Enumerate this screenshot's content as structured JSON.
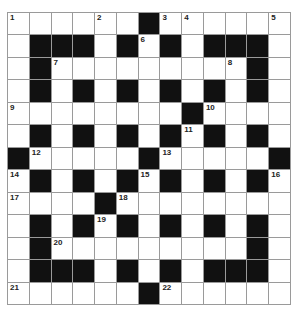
{
  "puzzle": {
    "rows": 13,
    "cols": 13,
    "colors": {
      "black": "#111111",
      "white": "#ffffff",
      "grid_line": "#9a9a9a"
    },
    "layout": [
      "WWWWWWBWWWWWW",
      "WBBBWBWBWBBBW",
      "WBWWWWWWWWWBW",
      "WBWBWBWBWBWBW",
      "WWWWWWWWBWWWW",
      "WBWBWBWBWBWBW",
      "BWWWWWBWWWWWB",
      "WBWBWBWBWBWBW",
      "WWWWBWWWWWWWW",
      "WBWBWBWBWBWBW",
      "WBWWWWWWWWWBW",
      "WBBBWBWBWBBBW",
      "WWWWWWBWWWWWW"
    ],
    "numbers": [
      {
        "r": 0,
        "c": 0,
        "n": "1"
      },
      {
        "r": 0,
        "c": 4,
        "n": "2"
      },
      {
        "r": 0,
        "c": 7,
        "n": "3"
      },
      {
        "r": 0,
        "c": 8,
        "n": "4"
      },
      {
        "r": 0,
        "c": 12,
        "n": "5"
      },
      {
        "r": 1,
        "c": 6,
        "n": "6"
      },
      {
        "r": 2,
        "c": 2,
        "n": "7"
      },
      {
        "r": 2,
        "c": 10,
        "n": "8"
      },
      {
        "r": 4,
        "c": 0,
        "n": "9"
      },
      {
        "r": 4,
        "c": 9,
        "n": "10"
      },
      {
        "r": 5,
        "c": 8,
        "n": "11"
      },
      {
        "r": 6,
        "c": 1,
        "n": "12"
      },
      {
        "r": 6,
        "c": 7,
        "n": "13"
      },
      {
        "r": 7,
        "c": 0,
        "n": "14"
      },
      {
        "r": 7,
        "c": 6,
        "n": "15"
      },
      {
        "r": 7,
        "c": 12,
        "n": "16"
      },
      {
        "r": 8,
        "c": 0,
        "n": "17"
      },
      {
        "r": 8,
        "c": 5,
        "n": "18"
      },
      {
        "r": 9,
        "c": 4,
        "n": "19"
      },
      {
        "r": 10,
        "c": 2,
        "n": "20"
      },
      {
        "r": 12,
        "c": 0,
        "n": "21"
      },
      {
        "r": 12,
        "c": 7,
        "n": "22"
      }
    ]
  }
}
